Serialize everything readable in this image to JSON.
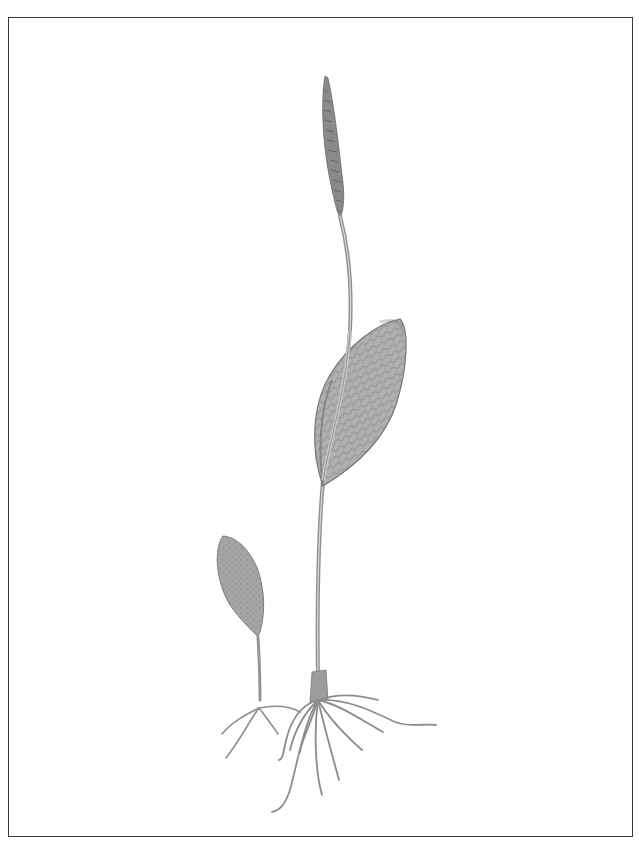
{
  "illustration": {
    "subject": "botanical drawing of two adder's-tongue fern plants",
    "style": "graphite pencil",
    "colors": {
      "background": "#ffffff",
      "border": "#3a3a3a",
      "leaf_fill": "#a9a9a9",
      "leaf_shade": "#7d7d7d",
      "stem": "#9a9a9a",
      "root": "#8c8c8c",
      "spike": "#6f6f6f"
    },
    "elements": [
      {
        "name": "fertile-spike",
        "description": "narrow toothed spore spike at top of tall stalk"
      },
      {
        "name": "tall-stalk",
        "description": "long slender stalk rising from roots"
      },
      {
        "name": "large-leaf",
        "description": "ovate sterile frond with net venation clasping stalk"
      },
      {
        "name": "small-plant-leaf",
        "description": "small ovate leaf of young plant on left"
      },
      {
        "name": "roots",
        "description": "fibrous spreading roots of both plants"
      }
    ]
  }
}
